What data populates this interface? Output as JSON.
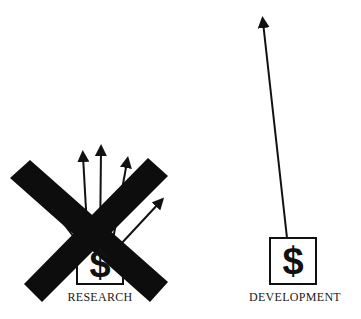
{
  "diagram": {
    "left": {
      "label": "RESEARCH",
      "symbol": "$",
      "arrows_count": 5,
      "crossed_out": true
    },
    "right": {
      "label": "DEVELOPMENT",
      "symbol": "$",
      "arrows_count": 1,
      "crossed_out": false
    },
    "colors": {
      "ink": "#111111",
      "background": "#ffffff"
    }
  }
}
